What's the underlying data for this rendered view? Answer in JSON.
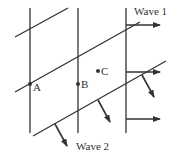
{
  "diagram": {
    "colors": {
      "line": "#333333",
      "background": "#ffffff"
    },
    "wave1": {
      "label": "Wave 1",
      "label_pos": [
        134,
        15
      ],
      "crest_lines": [
        {
          "x1": 30,
          "y1": 8,
          "x2": 30,
          "y2": 133
        },
        {
          "x1": 78,
          "y1": 8,
          "x2": 78,
          "y2": 133
        },
        {
          "x1": 126,
          "y1": 8,
          "x2": 126,
          "y2": 133
        }
      ],
      "arrows": [
        {
          "x1": 126,
          "y1": 25,
          "x2": 160,
          "y2": 25
        },
        {
          "x1": 126,
          "y1": 72,
          "x2": 160,
          "y2": 72
        },
        {
          "x1": 126,
          "y1": 119,
          "x2": 160,
          "y2": 119
        }
      ]
    },
    "wave2": {
      "label": "Wave 2",
      "label_pos": [
        76,
        150
      ],
      "crest_lines": [
        {
          "x1": 15,
          "y1": 37,
          "x2": 68,
          "y2": 8
        },
        {
          "x1": 15,
          "y1": 92,
          "x2": 140,
          "y2": 22
        },
        {
          "x1": 33,
          "y1": 136,
          "x2": 166,
          "y2": 61
        }
      ],
      "arrows": [
        {
          "x1": 55,
          "y1": 124,
          "x2": 67,
          "y2": 146
        },
        {
          "x1": 98,
          "y1": 100,
          "x2": 110,
          "y2": 122
        },
        {
          "x1": 142,
          "y1": 75,
          "x2": 154,
          "y2": 97
        }
      ]
    },
    "points": [
      {
        "label": "A",
        "x": 30,
        "y": 84,
        "label_dx": 3,
        "label_dy": 7
      },
      {
        "label": "B",
        "x": 78,
        "y": 84,
        "label_dx": 3,
        "label_dy": 4
      },
      {
        "label": "C",
        "x": 98,
        "y": 71,
        "label_dx": 3,
        "label_dy": 4
      }
    ]
  }
}
